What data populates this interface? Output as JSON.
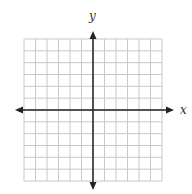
{
  "diagram": {
    "type": "coordinate-grid",
    "x_axis_label": "x",
    "y_axis_label": "y",
    "grid": {
      "columns": 12,
      "rows": 12,
      "left": 24,
      "top": 39,
      "right": 162,
      "bottom": 181,
      "line_color": "#c8c8c8"
    },
    "axes": {
      "origin_x": 93,
      "origin_y": 110,
      "x_arrow_left": 15,
      "x_arrow_right": 174,
      "y_arrow_top": 31,
      "y_arrow_bottom": 190,
      "color": "#222222"
    }
  }
}
